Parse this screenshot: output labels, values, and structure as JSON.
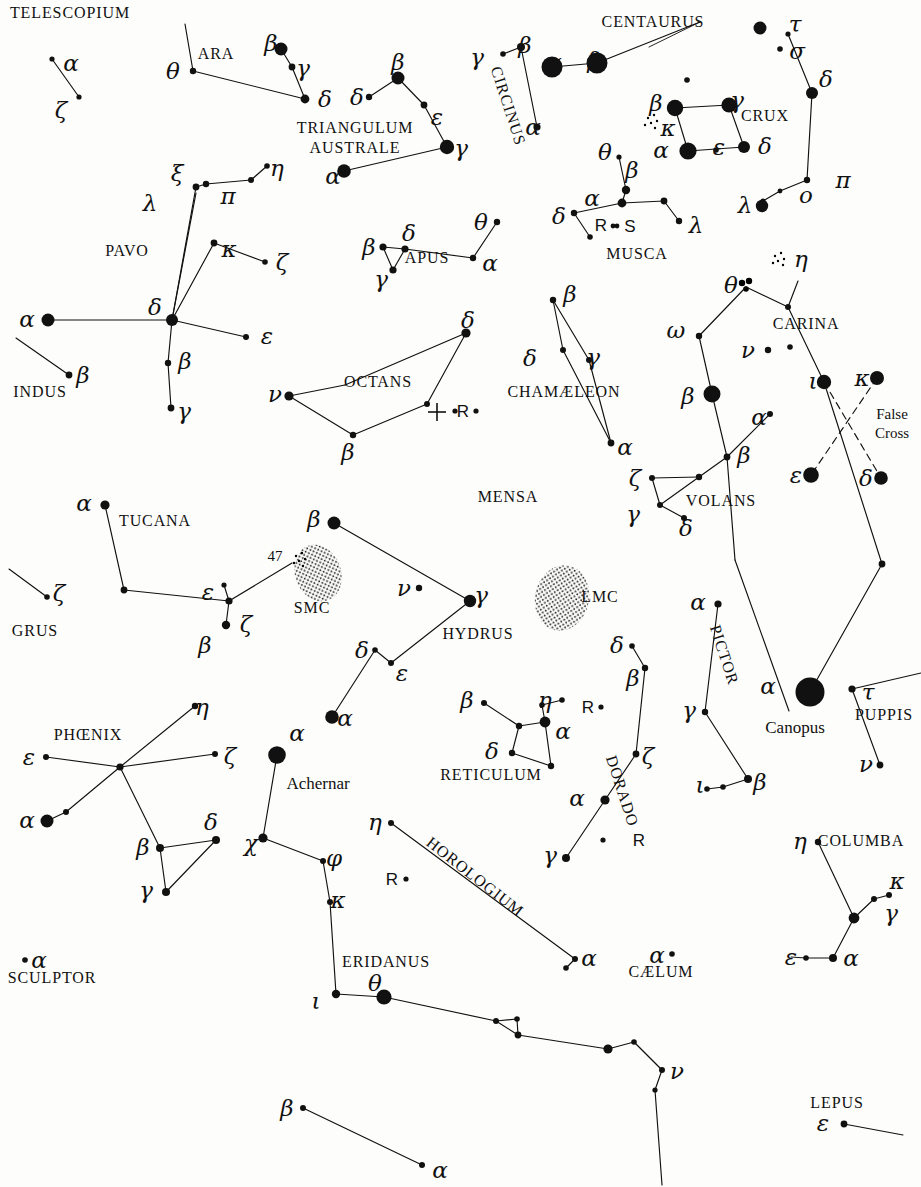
{
  "chart_data": {
    "type": "star-chart",
    "background": "#fdfdfb",
    "ink": "#111111",
    "width": 921,
    "height": 1187,
    "pole_marker": {
      "label": "+",
      "x": 437,
      "y": 412,
      "note": "south celestial pole"
    },
    "constellations": [
      {
        "name": "TELESCOPIUM",
        "label_x": 70,
        "label_y": 13
      },
      {
        "name": "ARA",
        "label_x": 216,
        "label_y": 54
      },
      {
        "name": "TRIANGULUM",
        "label_x": 355,
        "label_y": 128
      },
      {
        "name": "AUSTRALE",
        "label_x": 355,
        "label_y": 148
      },
      {
        "name": "CIRCINUS",
        "label_x": 508,
        "label_y": 106,
        "rotate": 72
      },
      {
        "name": "CENTAURUS",
        "label_x": 653,
        "label_y": 22
      },
      {
        "name": "CRUX",
        "label_x": 765,
        "label_y": 116
      },
      {
        "name": "MUSCA",
        "label_x": 637,
        "label_y": 254
      },
      {
        "name": "PAVO",
        "label_x": 127,
        "label_y": 251
      },
      {
        "name": "APUS",
        "label_x": 427,
        "label_y": 258
      },
      {
        "name": "INDUS",
        "label_x": 40,
        "label_y": 392
      },
      {
        "name": "OCTANS",
        "label_x": 378,
        "label_y": 382
      },
      {
        "name": "CHAMÆLEON",
        "label_x": 564,
        "label_y": 392
      },
      {
        "name": "CARINA",
        "label_x": 806,
        "label_y": 324
      },
      {
        "name": "VOLANS",
        "label_x": 721,
        "label_y": 501
      },
      {
        "name": "MENSA",
        "label_x": 508,
        "label_y": 497
      },
      {
        "name": "TUCANA",
        "label_x": 155,
        "label_y": 521
      },
      {
        "name": "GRUS",
        "label_x": 35,
        "label_y": 631
      },
      {
        "name": "SMC",
        "label_x": 312,
        "label_y": 608
      },
      {
        "name": "LMC",
        "label_x": 600,
        "label_y": 597
      },
      {
        "name": "HYDRUS",
        "label_x": 478,
        "label_y": 634
      },
      {
        "name": "PHŒNIX",
        "label_x": 88,
        "label_y": 735
      },
      {
        "name": "RETICULUM",
        "label_x": 491,
        "label_y": 775
      },
      {
        "name": "DORADO",
        "label_x": 622,
        "label_y": 791,
        "rotate": 72
      },
      {
        "name": "PICTOR",
        "label_x": 724,
        "label_y": 655,
        "rotate": 72
      },
      {
        "name": "PUPPIS",
        "label_x": 884,
        "label_y": 715
      },
      {
        "name": "HOROLOGIUM",
        "label_x": 475,
        "label_y": 877,
        "rotate": 38
      },
      {
        "name": "ERIDANUS",
        "label_x": 386,
        "label_y": 962
      },
      {
        "name": "CÆLUM",
        "label_x": 661,
        "label_y": 972
      },
      {
        "name": "COLUMBA",
        "label_x": 861,
        "label_y": 841
      },
      {
        "name": "SCULPTOR",
        "label_x": 52,
        "label_y": 978
      },
      {
        "name": "LEPUS",
        "label_x": 837,
        "label_y": 1103
      }
    ],
    "named_stars": [
      {
        "name": "Canopus",
        "x": 795,
        "y": 727
      },
      {
        "name": "Achernar",
        "x": 318,
        "y": 783
      }
    ],
    "special_labels": [
      {
        "text": "False",
        "x": 892,
        "y": 415
      },
      {
        "text": "Cross",
        "x": 892,
        "y": 434
      },
      {
        "text": "47",
        "x": 275,
        "y": 557
      }
    ],
    "greek_labels": [
      {
        "g": "α",
        "x": 71,
        "y": 63
      },
      {
        "g": "ζ",
        "x": 61,
        "y": 110
      },
      {
        "g": "θ",
        "x": 173,
        "y": 71
      },
      {
        "g": "β",
        "x": 271,
        "y": 43
      },
      {
        "g": "γ",
        "x": 303,
        "y": 68
      },
      {
        "g": "δ",
        "x": 325,
        "y": 99
      },
      {
        "g": "δ",
        "x": 357,
        "y": 97
      },
      {
        "g": "β",
        "x": 398,
        "y": 62
      },
      {
        "g": "ε",
        "x": 437,
        "y": 117
      },
      {
        "g": "γ",
        "x": 461,
        "y": 148
      },
      {
        "g": "α",
        "x": 333,
        "y": 176
      },
      {
        "g": "γ",
        "x": 477,
        "y": 57
      },
      {
        "g": "β",
        "x": 525,
        "y": 45
      },
      {
        "g": "α",
        "x": 533,
        "y": 127
      },
      {
        "g": "α",
        "x": 554,
        "y": 62
      },
      {
        "g": "β",
        "x": 594,
        "y": 60
      },
      {
        "g": "τ",
        "x": 795,
        "y": 24
      },
      {
        "g": "σ",
        "x": 797,
        "y": 51
      },
      {
        "g": "δ",
        "x": 826,
        "y": 79
      },
      {
        "g": "π",
        "x": 843,
        "y": 180
      },
      {
        "g": "λ",
        "x": 745,
        "y": 205
      },
      {
        "g": "ο",
        "x": 806,
        "y": 195
      },
      {
        "g": "β",
        "x": 656,
        "y": 103
      },
      {
        "g": "γ",
        "x": 737,
        "y": 100
      },
      {
        "g": "κ",
        "x": 668,
        "y": 128
      },
      {
        "g": "α",
        "x": 661,
        "y": 150
      },
      {
        "g": "δ",
        "x": 765,
        "y": 146
      },
      {
        "g": "ε",
        "x": 719,
        "y": 147
      },
      {
        "g": "θ",
        "x": 605,
        "y": 152
      },
      {
        "g": "β",
        "x": 632,
        "y": 170
      },
      {
        "g": "α",
        "x": 592,
        "y": 198
      },
      {
        "g": "δ",
        "x": 559,
        "y": 216
      },
      {
        "g": "λ",
        "x": 696,
        "y": 225
      },
      {
        "g": "ξ",
        "x": 177,
        "y": 173
      },
      {
        "g": "π",
        "x": 228,
        "y": 196
      },
      {
        "g": "η",
        "x": 277,
        "y": 168
      },
      {
        "g": "λ",
        "x": 150,
        "y": 203
      },
      {
        "g": "κ",
        "x": 229,
        "y": 249
      },
      {
        "g": "ζ",
        "x": 282,
        "y": 262
      },
      {
        "g": "δ",
        "x": 155,
        "y": 307
      },
      {
        "g": "β",
        "x": 185,
        "y": 361
      },
      {
        "g": "γ",
        "x": 184,
        "y": 411
      },
      {
        "g": "ε",
        "x": 267,
        "y": 336
      },
      {
        "g": "α",
        "x": 27,
        "y": 319
      },
      {
        "g": "β",
        "x": 83,
        "y": 375
      },
      {
        "g": "β",
        "x": 369,
        "y": 247
      },
      {
        "g": "δ",
        "x": 409,
        "y": 233
      },
      {
        "g": "γ",
        "x": 381,
        "y": 279
      },
      {
        "g": "θ",
        "x": 481,
        "y": 222
      },
      {
        "g": "α",
        "x": 490,
        "y": 263
      },
      {
        "g": "δ",
        "x": 468,
        "y": 320
      },
      {
        "g": "ν",
        "x": 275,
        "y": 394
      },
      {
        "g": "β",
        "x": 348,
        "y": 452
      },
      {
        "g": "β",
        "x": 570,
        "y": 294
      },
      {
        "g": "δ",
        "x": 530,
        "y": 358
      },
      {
        "g": "γ",
        "x": 593,
        "y": 357
      },
      {
        "g": "α",
        "x": 625,
        "y": 447
      },
      {
        "g": "θ",
        "x": 731,
        "y": 285
      },
      {
        "g": "η",
        "x": 801,
        "y": 259
      },
      {
        "g": "ω",
        "x": 676,
        "y": 330
      },
      {
        "g": "ν",
        "x": 748,
        "y": 350
      },
      {
        "g": "β",
        "x": 688,
        "y": 396
      },
      {
        "g": "α",
        "x": 759,
        "y": 417
      },
      {
        "g": "ι",
        "x": 813,
        "y": 381
      },
      {
        "g": "κ",
        "x": 862,
        "y": 378
      },
      {
        "g": "ε",
        "x": 796,
        "y": 475
      },
      {
        "g": "δ",
        "x": 866,
        "y": 478
      },
      {
        "g": "ζ",
        "x": 635,
        "y": 478
      },
      {
        "g": "β",
        "x": 744,
        "y": 455
      },
      {
        "g": "γ",
        "x": 633,
        "y": 514
      },
      {
        "g": "δ",
        "x": 686,
        "y": 528
      },
      {
        "g": "α",
        "x": 84,
        "y": 503
      },
      {
        "g": "ε",
        "x": 208,
        "y": 592
      },
      {
        "g": "ζ",
        "x": 246,
        "y": 624
      },
      {
        "g": "β",
        "x": 205,
        "y": 645
      },
      {
        "g": "ζ",
        "x": 59,
        "y": 593
      },
      {
        "g": "β",
        "x": 314,
        "y": 519
      },
      {
        "g": "ν",
        "x": 404,
        "y": 588
      },
      {
        "g": "γ",
        "x": 481,
        "y": 595
      },
      {
        "g": "δ",
        "x": 362,
        "y": 650
      },
      {
        "g": "ε",
        "x": 402,
        "y": 673
      },
      {
        "g": "α",
        "x": 345,
        "y": 718
      },
      {
        "g": "η",
        "x": 202,
        "y": 707
      },
      {
        "g": "ζ",
        "x": 230,
        "y": 756
      },
      {
        "g": "ε",
        "x": 29,
        "y": 757
      },
      {
        "g": "α",
        "x": 27,
        "y": 820
      },
      {
        "g": "β",
        "x": 143,
        "y": 847
      },
      {
        "g": "δ",
        "x": 211,
        "y": 822
      },
      {
        "g": "γ",
        "x": 146,
        "y": 890
      },
      {
        "g": "α",
        "x": 297,
        "y": 733
      },
      {
        "g": "χ",
        "x": 251,
        "y": 843
      },
      {
        "g": "φ",
        "x": 334,
        "y": 858
      },
      {
        "g": "κ",
        "x": 338,
        "y": 900
      },
      {
        "g": "ι",
        "x": 316,
        "y": 1001
      },
      {
        "g": "θ",
        "x": 375,
        "y": 983
      },
      {
        "g": "β",
        "x": 287,
        "y": 1108
      },
      {
        "g": "α",
        "x": 440,
        "y": 1170
      },
      {
        "g": "β",
        "x": 467,
        "y": 700
      },
      {
        "g": "η",
        "x": 545,
        "y": 700
      },
      {
        "g": "α",
        "x": 563,
        "y": 731
      },
      {
        "g": "δ",
        "x": 492,
        "y": 751
      },
      {
        "g": "δ",
        "x": 617,
        "y": 645
      },
      {
        "g": "β",
        "x": 633,
        "y": 678
      },
      {
        "g": "ζ",
        "x": 648,
        "y": 756
      },
      {
        "g": "α",
        "x": 577,
        "y": 798
      },
      {
        "g": "γ",
        "x": 550,
        "y": 855
      },
      {
        "g": "α",
        "x": 698,
        "y": 602
      },
      {
        "g": "γ",
        "x": 689,
        "y": 710
      },
      {
        "g": "β",
        "x": 760,
        "y": 782
      },
      {
        "g": "ι",
        "x": 700,
        "y": 785
      },
      {
        "g": "α",
        "x": 768,
        "y": 686
      },
      {
        "g": "τ",
        "x": 868,
        "y": 692
      },
      {
        "g": "ν",
        "x": 866,
        "y": 764
      },
      {
        "g": "η",
        "x": 375,
        "y": 822
      },
      {
        "g": "α",
        "x": 589,
        "y": 958
      },
      {
        "g": "α",
        "x": 657,
        "y": 955
      },
      {
        "g": "α",
        "x": 39,
        "y": 960
      },
      {
        "g": "η",
        "x": 800,
        "y": 841
      },
      {
        "g": "κ",
        "x": 897,
        "y": 881
      },
      {
        "g": "γ",
        "x": 891,
        "y": 913
      },
      {
        "g": "α",
        "x": 851,
        "y": 958
      },
      {
        "g": "ε",
        "x": 791,
        "y": 957
      },
      {
        "g": "ν",
        "x": 677,
        "y": 1071
      },
      {
        "g": "ε",
        "x": 823,
        "y": 1123
      }
    ],
    "variable_star_labels": [
      {
        "t": "R",
        "x": 601,
        "y": 225
      },
      {
        "t": "S",
        "x": 630,
        "y": 226
      },
      {
        "t": "R",
        "x": 463,
        "y": 411
      },
      {
        "t": "R",
        "x": 588,
        "y": 707
      },
      {
        "t": "R",
        "x": 639,
        "y": 840
      },
      {
        "t": "R",
        "x": 392,
        "y": 879
      }
    ],
    "nebulae": [
      {
        "name": "SMC",
        "cx": 318,
        "cy": 573,
        "rx": 22,
        "ry": 28
      },
      {
        "name": "LMC",
        "cx": 562,
        "cy": 598,
        "rx": 26,
        "ry": 32
      }
    ]
  }
}
